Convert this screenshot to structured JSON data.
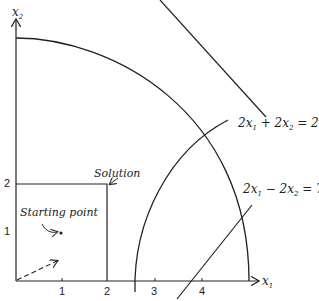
{
  "axes": {
    "x_label": "x",
    "x_sub": "1",
    "y_label": "x",
    "y_sub": "2",
    "x_ticks": [
      "1",
      "2",
      "3",
      "4"
    ],
    "y_ticks": [
      "1",
      "2"
    ]
  },
  "constraints": {
    "line1_lhs": "2x",
    "line1_s1": "1",
    "line1_mid": " + 2x",
    "line1_s2": "2",
    "line1_rhs": " = 27",
    "line2_lhs": "2x",
    "line2_s1": "1",
    "line2_mid": " − 2x",
    "line2_s2": "2",
    "line2_rhs": " = 7"
  },
  "annotations": {
    "solution": "Solution",
    "starting_point": "Starting point"
  },
  "colors": {
    "ink": "#222222",
    "background": "#ffffff"
  }
}
